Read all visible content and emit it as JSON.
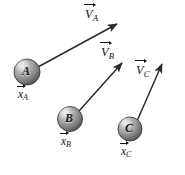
{
  "figure": {
    "background_color": "#ffffff",
    "width": 185,
    "height": 175,
    "ink_color": "#141414",
    "arrow_color": "#2b2b2b",
    "ball_colors": {
      "highlight": "#d8d8d8",
      "mid": "#9a9a9a",
      "shadow": "#4a4a4a",
      "outline": "#3b3b3b"
    }
  },
  "objects": [
    {
      "id": "A",
      "ball_letter": "A",
      "ball": {
        "cx": 27,
        "cy": 72,
        "r": 13
      },
      "position_label": {
        "symbol": "x",
        "subscript": "A",
        "x": 17,
        "y": 88
      },
      "velocity_label": {
        "symbol": "V",
        "subscript": "A",
        "x": 85,
        "y": 6
      },
      "velocity_arrow": {
        "x1": 38,
        "y1": 67,
        "x2": 119,
        "y2": 23
      }
    },
    {
      "id": "B",
      "ball_letter": "B",
      "ball": {
        "cx": 70,
        "cy": 119,
        "r": 12.5
      },
      "position_label": {
        "symbol": "x",
        "subscript": "B",
        "x": 60,
        "y": 135
      },
      "velocity_label": {
        "symbol": "V",
        "subscript": "B",
        "x": 101,
        "y": 44
      },
      "velocity_arrow": {
        "x1": 79,
        "y1": 111,
        "x2": 124,
        "y2": 61
      }
    },
    {
      "id": "C",
      "ball_letter": "C",
      "ball": {
        "cx": 130,
        "cy": 129,
        "r": 12
      },
      "position_label": {
        "symbol": "x",
        "subscript": "C",
        "x": 120,
        "y": 144
      },
      "velocity_label": {
        "symbol": "V",
        "subscript": "C",
        "x": 136,
        "y": 62
      },
      "velocity_arrow": {
        "x1": 137,
        "y1": 121,
        "x2": 164,
        "y2": 62
      }
    }
  ]
}
